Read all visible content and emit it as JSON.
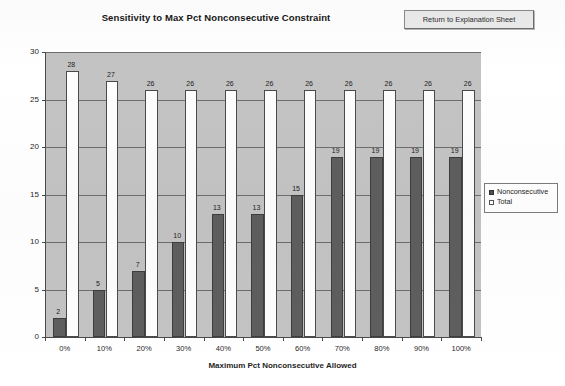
{
  "header": {
    "title": "Sensitivity to Max Pct Nonconsecutive Constraint",
    "return_button_label": "Return to Explanation Sheet"
  },
  "legend": {
    "items": [
      {
        "label": "Nonconsecutive",
        "marker": "filled-square",
        "color": "#4f4f4f"
      },
      {
        "label": "Total",
        "marker": "open-square",
        "color": "#ffffff"
      }
    ]
  },
  "colors": {
    "plot_background": "#c3c3c3",
    "gridline": "#6e6e6e",
    "axis": "#4a4a4a",
    "nonconsecutive_bar": "#5e5e5e",
    "total_bar": "#fdfdfd",
    "button_face": "#ebebeb"
  },
  "chart_data": {
    "type": "bar",
    "title": "Sensitivity to Max Pct Nonconsecutive Constraint",
    "xlabel": "Maximum Pct Nonconsecutive Allowed",
    "ylabel": "Number of workers",
    "categories": [
      "0%",
      "10%",
      "20%",
      "30%",
      "40%",
      "50%",
      "60%",
      "70%",
      "80%",
      "90%",
      "100%"
    ],
    "series": [
      {
        "name": "Nonconsecutive",
        "values": [
          2,
          5,
          7,
          10,
          13,
          13,
          15,
          19,
          19,
          19,
          19
        ]
      },
      {
        "name": "Total",
        "values": [
          28,
          27,
          26,
          26,
          26,
          26,
          26,
          26,
          26,
          26,
          26
        ]
      }
    ],
    "ylim": [
      0,
      30
    ],
    "yticks": [
      0,
      5,
      10,
      15,
      20,
      25,
      30
    ],
    "ytick_labels": [
      "0",
      "5",
      "10",
      "15",
      "20",
      "25",
      "30"
    ],
    "grid": true,
    "legend_position": "right",
    "data_labels": true
  }
}
